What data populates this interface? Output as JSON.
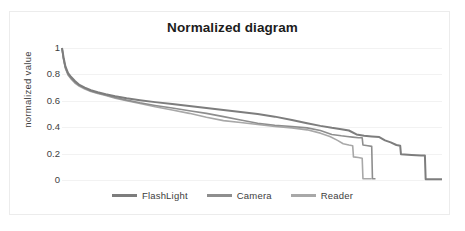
{
  "chart_data": {
    "type": "line",
    "title": "Normalized diagram",
    "xlabel": "",
    "ylabel": "normalized value",
    "ylim": [
      0,
      1
    ],
    "xlim": [
      0,
      100
    ],
    "grid": true,
    "legend_position": "bottom",
    "y_ticks": [
      "1",
      "0.8",
      "0.6",
      "0.4",
      "0.2",
      "0"
    ],
    "y_tick_values": [
      1,
      0.8,
      0.6,
      0.4,
      0.2,
      0
    ],
    "x_ticks": [],
    "series": [
      {
        "name": "FlashLight",
        "color": "#7d7d7d",
        "x": [
          0,
          0.4,
          0.9,
          1.6,
          2.4,
          3.4,
          4.6,
          6.0,
          7.6,
          9.4,
          11.5,
          14.0,
          17.0,
          20.5,
          24.5,
          29.0,
          33.5,
          38.0,
          42.5,
          47.0,
          51.5,
          56.0,
          60.5,
          64.5,
          68.0,
          71.0,
          73.5,
          75.5,
          77.5,
          79.5,
          81.5,
          83.5,
          85.0,
          86.5,
          88.0,
          89.0,
          89.2,
          92.0,
          94.5,
          95.5,
          95.7,
          100
        ],
        "y": [
          1.0,
          0.93,
          0.86,
          0.81,
          0.78,
          0.75,
          0.72,
          0.7,
          0.68,
          0.665,
          0.65,
          0.635,
          0.62,
          0.605,
          0.59,
          0.575,
          0.56,
          0.545,
          0.53,
          0.515,
          0.5,
          0.48,
          0.455,
          0.43,
          0.41,
          0.395,
          0.385,
          0.375,
          0.345,
          0.335,
          0.33,
          0.325,
          0.3,
          0.285,
          0.265,
          0.26,
          0.195,
          0.19,
          0.185,
          0.185,
          0.005,
          0.005
        ]
      },
      {
        "name": "Camera",
        "color": "#8e8e8e",
        "x": [
          0,
          0.4,
          0.9,
          1.6,
          2.4,
          3.4,
          4.6,
          6.0,
          7.6,
          9.4,
          11.5,
          14.0,
          17.0,
          20.5,
          24.5,
          29.0,
          33.5,
          38.0,
          42.5,
          47.0,
          51.5,
          56.0,
          60.5,
          64.5,
          68.0,
          71.0,
          73.5,
          75.0,
          76.5,
          78.0,
          79.0,
          79.2,
          80.5,
          81.5,
          81.7,
          82.5
        ],
        "y": [
          1.0,
          0.92,
          0.85,
          0.8,
          0.77,
          0.74,
          0.715,
          0.695,
          0.675,
          0.66,
          0.645,
          0.625,
          0.605,
          0.585,
          0.565,
          0.545,
          0.525,
          0.505,
          0.48,
          0.455,
          0.43,
          0.415,
          0.405,
          0.395,
          0.375,
          0.345,
          0.335,
          0.33,
          0.325,
          0.32,
          0.32,
          0.265,
          0.26,
          0.255,
          0.01,
          0.01
        ]
      },
      {
        "name": "Reader",
        "color": "#a8a8a8",
        "x": [
          0,
          0.4,
          0.9,
          1.6,
          2.4,
          3.4,
          4.6,
          6.0,
          7.6,
          9.4,
          11.5,
          14.0,
          17.0,
          20.5,
          24.5,
          29.0,
          33.5,
          38.0,
          42.5,
          47.0,
          51.5,
          56.0,
          60.5,
          64.5,
          68.0,
          70.5,
          72.5,
          74.0,
          75.5,
          76.5,
          76.7,
          78.0,
          79.0,
          79.2,
          81.5
        ],
        "y": [
          1.0,
          0.915,
          0.845,
          0.795,
          0.765,
          0.735,
          0.71,
          0.69,
          0.67,
          0.655,
          0.64,
          0.62,
          0.6,
          0.58,
          0.555,
          0.53,
          0.505,
          0.475,
          0.45,
          0.435,
          0.42,
          0.405,
          0.395,
          0.38,
          0.355,
          0.33,
          0.3,
          0.275,
          0.265,
          0.26,
          0.175,
          0.17,
          0.165,
          0.01,
          0.01
        ]
      }
    ]
  },
  "legend": {
    "items": [
      {
        "label": "FlashLight",
        "color": "#7d7d7d"
      },
      {
        "label": "Camera",
        "color": "#8e8e8e"
      },
      {
        "label": "Reader",
        "color": "#a8a8a8"
      }
    ]
  }
}
